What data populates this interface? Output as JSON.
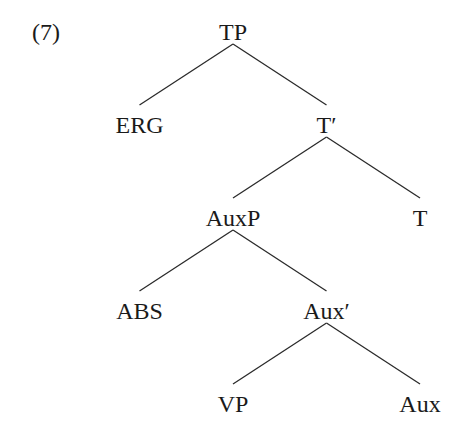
{
  "example_number": "(7)",
  "tree": {
    "label": "TP",
    "children": [
      {
        "label": "ERG",
        "children": []
      },
      {
        "label": "T′",
        "children": [
          {
            "label": "AuxP",
            "children": [
              {
                "label": "ABS",
                "children": []
              },
              {
                "label": "Aux′",
                "children": [
                  {
                    "label": "VP",
                    "children": []
                  },
                  {
                    "label": "Aux",
                    "children": []
                  }
                ]
              }
            ]
          },
          {
            "label": "T",
            "children": []
          }
        ]
      }
    ]
  }
}
